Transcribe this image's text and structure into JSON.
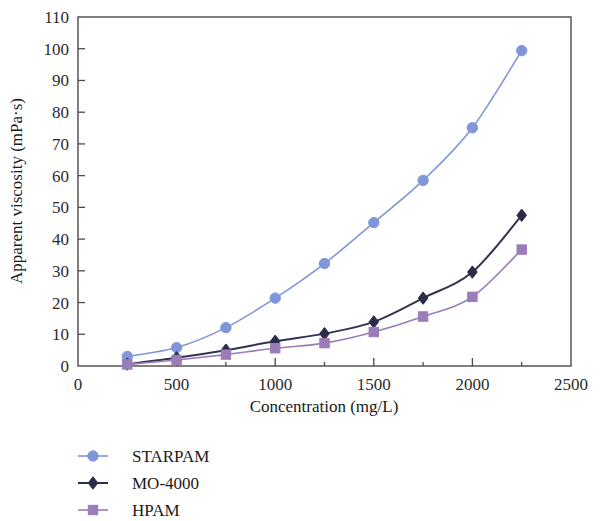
{
  "chart_data": {
    "type": "line",
    "title": "",
    "xlabel": "Concentration (mg/L)",
    "ylabel": "Apparent viscosity (mPa·s)",
    "x": [
      250,
      500,
      750,
      1000,
      1250,
      1500,
      1750,
      2000,
      2250
    ],
    "xlim": [
      0,
      2500
    ],
    "ylim": [
      0,
      110
    ],
    "xticks": [
      0,
      500,
      1000,
      1500,
      2000,
      2500
    ],
    "xtick_labels": [
      "0",
      "500",
      "1000",
      "1500",
      "2000",
      "2500"
    ],
    "xminor_ticks": [
      250,
      750,
      1250,
      1750,
      2250
    ],
    "yticks": [
      0,
      10,
      20,
      30,
      40,
      50,
      60,
      70,
      80,
      90,
      100,
      110
    ],
    "ytick_labels": [
      "0",
      "10",
      "20",
      "30",
      "40",
      "50",
      "60",
      "70",
      "80",
      "90",
      "100",
      "110"
    ],
    "grid": false,
    "legend_position": "below-left",
    "series": [
      {
        "name": "STARPAM",
        "marker": "circle",
        "color": "#8196d8",
        "line_color": "#8196d8",
        "values": [
          3.0,
          5.8,
          12.1,
          21.4,
          32.3,
          45.2,
          58.5,
          75.1,
          99.4
        ]
      },
      {
        "name": "MO-4000",
        "marker": "diamond",
        "color": "#2b2b4a",
        "line_color": "#33334f",
        "values": [
          0.6,
          2.6,
          5.0,
          7.8,
          10.2,
          13.9,
          21.4,
          29.6,
          47.5
        ]
      },
      {
        "name": "HPAM",
        "marker": "square",
        "color": "#9a7cb8",
        "line_color": "#9a7cb8",
        "values": [
          0.5,
          1.9,
          3.6,
          5.6,
          7.2,
          10.7,
          15.6,
          21.8,
          36.7
        ]
      }
    ]
  },
  "legend": {
    "items": [
      {
        "label": "STARPAM",
        "marker": "circle",
        "color": "#8196d8"
      },
      {
        "label": "MO-4000",
        "marker": "diamond",
        "color": "#2b2b4a"
      },
      {
        "label": "HPAM",
        "marker": "square",
        "color": "#9a7cb8"
      }
    ]
  }
}
